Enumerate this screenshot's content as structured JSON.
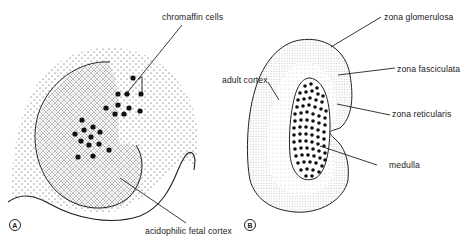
{
  "figure": {
    "panels": [
      {
        "id": "A",
        "letter": "A",
        "labels": {
          "chromaffin": "chromaffin cells",
          "fetal_cortex": "acidophilic fetal cortex"
        }
      },
      {
        "id": "B",
        "letter": "B",
        "labels": {
          "glomerulosa": "zona glomerulosa",
          "fasciculata": "zona fasciculata",
          "reticularis": "zona reticularis",
          "adult_cortex": "adult cortex",
          "medulla": "medulla"
        }
      }
    ]
  },
  "colors": {
    "ink": "#222222",
    "background": "#ffffff"
  }
}
